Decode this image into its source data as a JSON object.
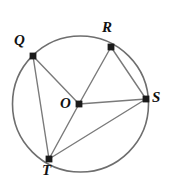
{
  "figure": {
    "background_color": "#ffffff",
    "stroke_color": "#6e6e6e",
    "chord_color": "#7a7a7a",
    "point_color": "#1a1a1a",
    "label_color": "#111111",
    "circle": {
      "center_label": "O",
      "cx": 80.5,
      "cy": 104,
      "r": 68,
      "stroke_width": 1.6
    },
    "points": [
      {
        "id": "Q",
        "label": "Q",
        "x": 33,
        "y": 56,
        "label_x": 14,
        "label_y": 33
      },
      {
        "id": "R",
        "label": "R",
        "x": 111,
        "y": 47,
        "label_x": 102,
        "label_y": 20
      },
      {
        "id": "S",
        "label": "S",
        "x": 146,
        "y": 99,
        "label_x": 152,
        "label_y": 90
      },
      {
        "id": "T",
        "label": "T",
        "x": 49,
        "y": 159,
        "label_x": 42,
        "label_y": 163
      },
      {
        "id": "O",
        "label": "O",
        "x": 79,
        "y": 104,
        "label_x": 60,
        "label_y": 96
      }
    ],
    "segments": [
      {
        "from": "Q",
        "to": "O"
      },
      {
        "from": "Q",
        "to": "T"
      },
      {
        "from": "O",
        "to": "R"
      },
      {
        "from": "O",
        "to": "S"
      },
      {
        "from": "O",
        "to": "T"
      },
      {
        "from": "R",
        "to": "S"
      },
      {
        "from": "T",
        "to": "S"
      }
    ],
    "labels": {
      "Q": "Q",
      "R": "R",
      "S": "S",
      "T": "T",
      "O": "O"
    }
  }
}
